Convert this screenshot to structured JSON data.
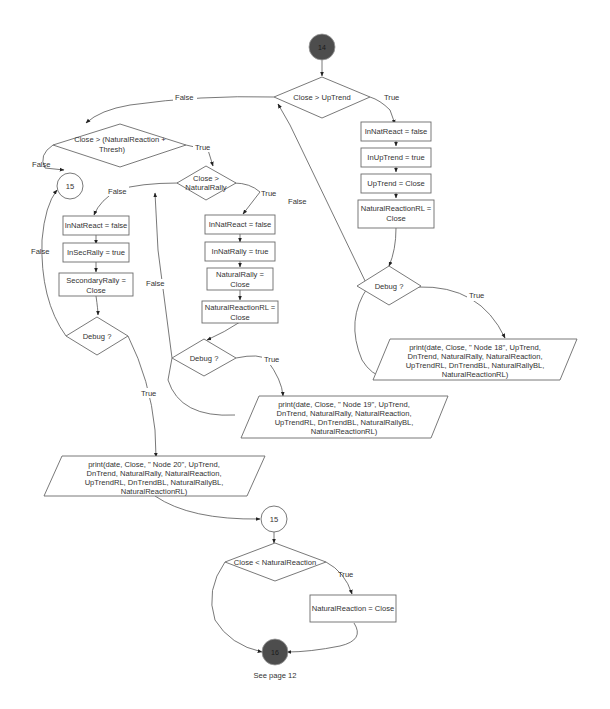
{
  "nodes": {
    "start": {
      "label": "14"
    },
    "d_close_uptrend": {
      "label": "Close > UpTrend"
    },
    "d_close_nr_thresh": {
      "line1": "Close > (NaturalReaction +",
      "line2": "Thresh)"
    },
    "conn15_top": {
      "label": "15"
    },
    "d_close_natrally": {
      "line1": "Close >",
      "line2": "NaturalRally"
    },
    "r_innatreact_false_a": {
      "label": "InNatReact = false"
    },
    "r_inuptrend_true": {
      "label": "InUpTrend = true"
    },
    "r_uptrend_close": {
      "label": "UpTrend = Close"
    },
    "r_nrrl_close_a": {
      "line1": "NaturalReactionRL =",
      "line2": "Close"
    },
    "d_debug_a": {
      "label": "Debug ?"
    },
    "p_print18": {
      "lines": [
        "print(date, Close, \" Node 18\", UpTrend,",
        "DnTrend, NaturalRally, NaturalReaction,",
        "UpTrendRL, DnTrendBL, NaturalRallyBL,",
        "NaturalReactionRL)"
      ]
    },
    "r_innatreact_false_b": {
      "label": "InNatReact = false"
    },
    "r_innatrally_true": {
      "label": "InNatRally = true"
    },
    "r_natrally_close": {
      "line1": "NaturalRally =",
      "line2": "Close"
    },
    "r_nrrl_close_b": {
      "line1": "NaturalReactionRL =",
      "line2": "Close"
    },
    "d_debug_b": {
      "label": "Debug ?"
    },
    "p_print19": {
      "lines": [
        "print(date, Close, \" Node 19\", UpTrend,",
        "DnTrend, NaturalRally, NaturalReaction,",
        "UpTrendRL, DnTrendBL, NaturalRallyBL,",
        "NaturalReactionRL)"
      ]
    },
    "r_innatreact_false_c": {
      "label": "InNatReact = false"
    },
    "r_insecrally_true": {
      "label": "InSecRally = true"
    },
    "r_secrally_close": {
      "line1": "SecondaryRally =",
      "line2": "Close"
    },
    "d_debug_c": {
      "label": "Debug ?"
    },
    "p_print20": {
      "lines": [
        "print(date, Close, \" Node 20\", UpTrend,",
        "DnTrend, NaturalRally, NaturalReaction,",
        "UpTrendRL, DnTrendBL, NaturalRallyBL,",
        "NaturalReactionRL)"
      ]
    },
    "conn15_mid": {
      "label": "15"
    },
    "d_close_lt_nr": {
      "label": "Close < NaturalReaction"
    },
    "r_nr_close": {
      "label": "NaturalReaction = Close"
    },
    "end": {
      "label": "16"
    },
    "end_note": {
      "label": "See page 12"
    }
  },
  "edge_labels": {
    "true": "True",
    "false": "False"
  },
  "colors": {
    "connector_fill": "#4d4d4d",
    "stroke": "#6a6a6a",
    "background": "#ffffff"
  }
}
